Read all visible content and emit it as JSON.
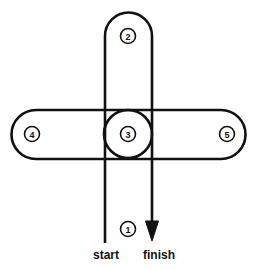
{
  "figure": {
    "title": "",
    "type": "route-loop-diagram",
    "background_color": "#ffffff",
    "stroke_color": "#111111"
  },
  "loops": {
    "vertical": {
      "name": "vertical-loop",
      "badge": "2",
      "badge_position": "top",
      "left_line_x": 105,
      "right_line_x": 152,
      "top_y": 12,
      "cap_radius": 24
    },
    "horizontal": {
      "name": "horizontal-loop",
      "left_badge": "4",
      "right_badge": "5",
      "left_x": 11,
      "right_x": 246,
      "top_y": 110,
      "bottom_y": 159,
      "cap_radius": 25
    },
    "center": {
      "name": "center-circle",
      "badge": "3",
      "cx": 128,
      "cy": 134,
      "r": 24
    }
  },
  "badges": [
    {
      "id": "badge-1",
      "label": "1",
      "cx": 128,
      "cy": 229
    },
    {
      "id": "badge-2",
      "label": "2",
      "cx": 128,
      "cy": 36
    },
    {
      "id": "badge-3",
      "label": "3",
      "cx": 128,
      "cy": 134
    },
    {
      "id": "badge-4",
      "label": "4",
      "cx": 32,
      "cy": 134
    },
    {
      "id": "badge-5",
      "label": "5",
      "cx": 227,
      "cy": 134
    }
  ],
  "labels": {
    "start": "start",
    "finish": "finish",
    "start_x": 106,
    "finish_x": 159,
    "text_y": 259
  },
  "arrow": {
    "name": "finish-arrow",
    "direction": "down",
    "x": 152,
    "tip_y": 241,
    "head_width": 13,
    "head_height": 20
  },
  "lines": {
    "start_line": {
      "x": 105,
      "from_y": 134,
      "to_y": 243
    },
    "finish_line": {
      "x": 152,
      "from_y": 134,
      "to_y": 241
    }
  }
}
